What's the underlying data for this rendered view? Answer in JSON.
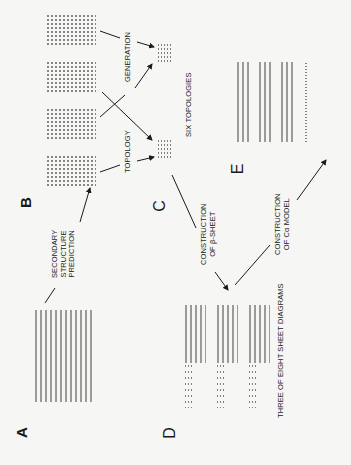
{
  "figure": {
    "orientation": "rotated 90° counterclockwise",
    "panels": [
      {
        "letter": "A",
        "content": "amino acid sequence listing"
      },
      {
        "letter": "B",
        "content": "four secondary structure / strand tables"
      },
      {
        "letter": "C",
        "content": "two topology strand lists"
      },
      {
        "letter": "D",
        "content": "three sheet diagrams"
      },
      {
        "letter": "E",
        "content": "C-alpha coordinate listing"
      }
    ],
    "labels": {
      "A": "A",
      "B": "B",
      "C": "C",
      "D": "D",
      "E": "E"
    },
    "steps": {
      "secondary_structure": [
        "SECONDARY",
        "STRUCTURE",
        "PREDICTION"
      ],
      "topology": "TOPOLOGY",
      "generation": "GENERATION",
      "six_topologies": "SIX TOPOLOGIES",
      "beta_sheet": [
        "CONSTRUCTION",
        "OF β-SHEET"
      ],
      "ca_model": [
        "CONSTRUCTION",
        "OF Cα MODEL"
      ],
      "sheet_diagrams": "THREE OF EIGHT SHEET DIAGRAMS"
    }
  }
}
